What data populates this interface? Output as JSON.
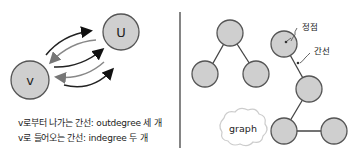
{
  "left_panel": {
    "node_v": "v",
    "node_u": "U",
    "caption_line1": "v로부터 나가는 간선: outdegree 세 개",
    "caption_line2": "v로 들어오는 간선: indegree 두 개",
    "arrows": {
      "outgoing_count": 3,
      "incoming_count": 2
    }
  },
  "right_panel": {
    "annotation_vertex": "정점",
    "annotation_edge": "간선",
    "cloud_label": "graph"
  },
  "colors": {
    "node_fill": "#cfcfcf",
    "node_stroke": "#555555",
    "divider": "#333333"
  }
}
